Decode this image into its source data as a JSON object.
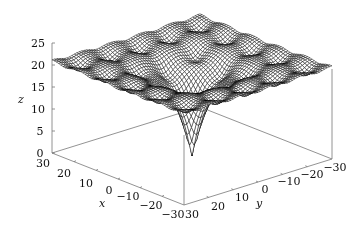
{
  "chart_data": {
    "type": "surface3d",
    "title": "",
    "function_hint": "Ackley-like surface: z = -20*exp(-0.2*sqrt(0.5*(x^2+y^2))) - exp(0.5*(cos(2*pi*x/5)+cos(2*pi*y/5))) + e + 20 (scaled)",
    "xlabel": "x",
    "ylabel": "y",
    "zlabel": "z",
    "xlim": [
      -30,
      30
    ],
    "ylim": [
      -30,
      30
    ],
    "zlim": [
      0,
      25
    ],
    "x_ticks": [
      "30",
      "20",
      "10",
      "0",
      "−10",
      "−20",
      "−30"
    ],
    "y_ticks": [
      "30",
      "20",
      "10",
      "0",
      "−10",
      "−20",
      "−30"
    ],
    "z_ticks": [
      "0",
      "5",
      "10",
      "15",
      "20",
      "25"
    ],
    "surface_min": {
      "x": 0,
      "y": 0,
      "z": 0
    },
    "surface_plateau_z": 20,
    "grid": false,
    "legend": null,
    "mesh_color": "#000000"
  },
  "labels": {
    "x": "x",
    "y": "y",
    "z": "z"
  }
}
